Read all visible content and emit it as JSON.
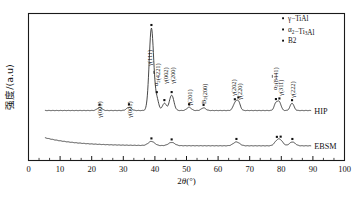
{
  "figure": {
    "background": "#ffffff",
    "frame_color": "#1a1a1a",
    "curve_color": "#333333",
    "marker_color": "#111111"
  },
  "axes": {
    "x": {
      "label": "2θ(°)",
      "label_italic_part": "θ",
      "ticks": [
        "0",
        "10",
        "20",
        "30",
        "40",
        "50",
        "60",
        "70",
        "80",
        "90",
        "100"
      ],
      "min": 0,
      "max": 100,
      "minor_ticks_per_interval": 2
    },
    "y": {
      "label": "强度/(a.u)",
      "ticks": [],
      "show_tick_labels": false
    }
  },
  "legend": {
    "position": "top-right",
    "items": [
      {
        "marker": "dot",
        "label": "γ−TiAl"
      },
      {
        "marker": "dot",
        "label": "α₂−Ti₃Al"
      },
      {
        "marker": "dot",
        "label": "B2"
      }
    ]
  },
  "curve_labels": [
    {
      "name": "HIP",
      "text": "HIP"
    },
    {
      "name": "EBSM",
      "text": "EBSM"
    }
  ],
  "peak_labels": [
    {
      "text": "γ(001)",
      "two_theta": 22.5,
      "series": "HIP"
    },
    {
      "text": "γ(001)",
      "two_theta": 31.8,
      "series": "HIP"
    },
    {
      "text": "γ(111)",
      "two_theta": 38.9,
      "series": "HIP"
    },
    {
      "text": "α₂(4221)",
      "two_theta": 40.6,
      "series": "HIP",
      "overbar": "2"
    },
    {
      "text": "γ(002)",
      "two_theta": 43.0,
      "series": "HIP"
    },
    {
      "text": "γ(200)",
      "two_theta": 45.3,
      "series": "HIP"
    },
    {
      "text": "γ(201)",
      "two_theta": 50.8,
      "series": "HIP"
    },
    {
      "text": "B₂(200)",
      "two_theta": 55.4,
      "series": "HIP"
    },
    {
      "text": "γ(202)",
      "two_theta": 65.3,
      "series": "HIP"
    },
    {
      "text": "γ(220)",
      "two_theta": 66.4,
      "series": "HIP"
    },
    {
      "text": "α₂(8441)",
      "two_theta": 78.3,
      "series": "HIP",
      "overbar": "4"
    },
    {
      "text": "γ(311)",
      "two_theta": 79.4,
      "series": "HIP"
    },
    {
      "text": "γ(222)",
      "two_theta": 83.4,
      "series": "HIP"
    }
  ],
  "chart_data": {
    "type": "line",
    "title": "",
    "xlabel": "2θ(°)",
    "ylabel": "强度/(a.u)",
    "xlim": [
      0,
      100
    ],
    "ylim": [
      0,
      1
    ],
    "grid": false,
    "legend_position": "top-right",
    "series": [
      {
        "name": "HIP",
        "baseline": 0.34,
        "x_start": 5.2,
        "x_end": 89.5,
        "peaks": [
          {
            "x": 22.5,
            "height": 0.02,
            "width": 0.75,
            "marker": "γ-TiAl"
          },
          {
            "x": 31.8,
            "height": 0.022,
            "width": 0.75,
            "marker": "γ-TiAl"
          },
          {
            "x": 38.9,
            "height": 0.56,
            "width": 0.7,
            "marker": "γ-TiAl"
          },
          {
            "x": 40.6,
            "height": 0.075,
            "width": 0.6,
            "marker": "α₂-Ti₃Al"
          },
          {
            "x": 43.0,
            "height": 0.05,
            "width": 0.6,
            "marker": "γ-TiAl"
          },
          {
            "x": 45.3,
            "height": 0.105,
            "width": 0.7,
            "marker": "γ-TiAl"
          },
          {
            "x": 50.8,
            "height": 0.022,
            "width": 0.7,
            "marker": "γ-TiAl"
          },
          {
            "x": 55.4,
            "height": 0.018,
            "width": 0.7,
            "marker": "B2"
          },
          {
            "x": 65.3,
            "height": 0.045,
            "width": 0.6,
            "marker": "γ-TiAl"
          },
          {
            "x": 66.4,
            "height": 0.06,
            "width": 0.6,
            "marker": "γ-TiAl"
          },
          {
            "x": 78.3,
            "height": 0.05,
            "width": 0.55,
            "marker": "α₂-Ti₃Al"
          },
          {
            "x": 79.4,
            "height": 0.055,
            "width": 0.55,
            "marker": "γ-TiAl"
          },
          {
            "x": 83.4,
            "height": 0.05,
            "width": 0.6,
            "marker": "γ-TiAl"
          }
        ]
      },
      {
        "name": "EBSM",
        "baseline": 0.1,
        "x_start": 5.2,
        "x_end": 89.5,
        "decay_amplitude": 0.055,
        "decay_rate": 0.1,
        "peaks": [
          {
            "x": 38.9,
            "height": 0.028,
            "width": 1.0,
            "marker": "γ-TiAl"
          },
          {
            "x": 45.3,
            "height": 0.022,
            "width": 1.0,
            "marker": "γ-TiAl"
          },
          {
            "x": 65.8,
            "height": 0.026,
            "width": 1.0,
            "marker": "γ-TiAl"
          },
          {
            "x": 78.6,
            "height": 0.03,
            "width": 0.8,
            "marker": "α₂-Ti₃Al"
          },
          {
            "x": 79.8,
            "height": 0.032,
            "width": 0.8,
            "marker": "γ-TiAl"
          },
          {
            "x": 83.5,
            "height": 0.026,
            "width": 0.9,
            "marker": "γ-TiAl"
          }
        ]
      }
    ]
  }
}
